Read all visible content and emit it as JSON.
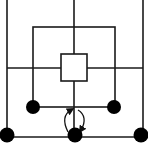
{
  "diagram": {
    "type": "mill-board-move-diagram",
    "colors": {
      "background": "#ffffff",
      "line": "#1a1a1a",
      "piece": "#000000"
    },
    "pieces": [
      {
        "id": "inner-left",
        "color": "black",
        "x": 33,
        "y": 107
      },
      {
        "id": "inner-right",
        "color": "black",
        "x": 114,
        "y": 107
      },
      {
        "id": "outer-left",
        "color": "black",
        "x": 7,
        "y": 135
      },
      {
        "id": "outer-center",
        "color": "black",
        "x": 75,
        "y": 135
      },
      {
        "id": "outer-right",
        "color": "black",
        "x": 141,
        "y": 135
      }
    ],
    "arrows": [
      {
        "id": "move-up",
        "direction": "up",
        "from": "outer-center",
        "to": "middle-bottom-junction"
      },
      {
        "id": "move-down",
        "direction": "down",
        "from": "middle-bottom-junction",
        "to": "outer-center"
      }
    ]
  }
}
